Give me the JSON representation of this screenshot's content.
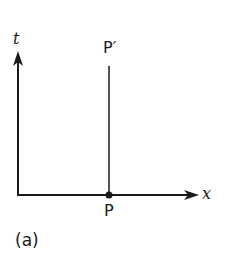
{
  "diagram": {
    "type": "spacetime-diagram",
    "axes": {
      "vertical_label": "t",
      "horizontal_label": "x"
    },
    "points": [
      {
        "label": "P",
        "position": "on x-axis"
      },
      {
        "label": "P′",
        "position": "top of vertical worldline above P"
      }
    ],
    "worldline": "vertical line from P to P′",
    "caption": "(a)",
    "colors": {
      "ink": "#1a1a1a",
      "background": "#ffffff"
    }
  }
}
